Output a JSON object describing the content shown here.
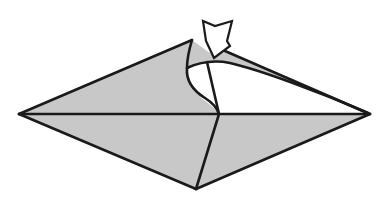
{
  "diagram": {
    "type": "origami fold step",
    "subject": "kite / diamond base with top flap being opened and squash-folded",
    "colors": {
      "paper": "#c8c8c8",
      "outline": "#1a1a1a",
      "background": "#ffffff",
      "arrow_fill": "#ffffff"
    },
    "points": {
      "left_tip": [
        19,
        114
      ],
      "right_tip": [
        370,
        114
      ],
      "top_tip": [
        192,
        40
      ],
      "bottom_tip": [
        196,
        189
      ],
      "center_crease": [
        219,
        114
      ]
    },
    "arrows": [
      {
        "name": "push-arrow",
        "meaning": "push / open the flap down",
        "direction": "down-left"
      }
    ]
  }
}
